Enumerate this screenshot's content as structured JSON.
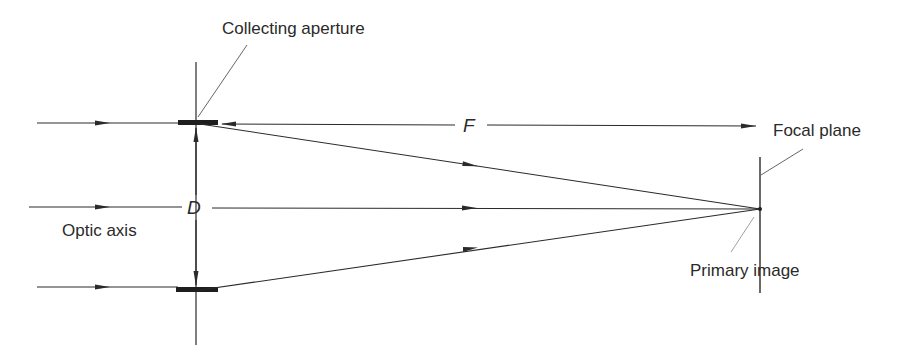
{
  "diagram": {
    "labels": {
      "collecting_aperture": "Collecting aperture",
      "focal_length": "F",
      "focal_plane": "Focal plane",
      "diameter": "D",
      "optic_axis": "Optic axis",
      "primary_image": "Primary image"
    },
    "colors": {
      "line": "#2a2a2a",
      "leader": "#555555",
      "background": "#ffffff"
    },
    "geometry": {
      "aperture_x": 196,
      "top_ray_y": 123,
      "axis_y": 208,
      "bottom_ray_y": 288,
      "focal_plane_x": 760,
      "focal_point_y": 209
    }
  }
}
